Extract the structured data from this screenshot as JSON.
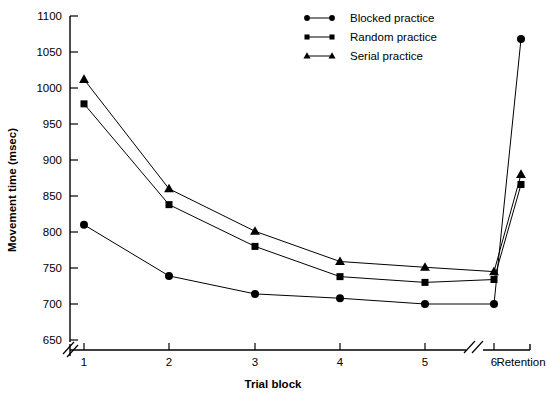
{
  "chart_data": {
    "type": "line",
    "title": "",
    "xlabel": "Trial block",
    "ylabel": "Movement time (msec)",
    "categories": [
      "1",
      "2",
      "3",
      "4",
      "5",
      "6",
      "Retention"
    ],
    "x_tick_labels": [
      "1",
      "2",
      "3",
      "4",
      "5",
      "6",
      "Retention"
    ],
    "y_tick_labels": [
      "650",
      "700",
      "750",
      "800",
      "850",
      "900",
      "950",
      "1000",
      "1050",
      "1100"
    ],
    "y_ticks": [
      650,
      700,
      750,
      800,
      850,
      900,
      950,
      1000,
      1050,
      1100
    ],
    "ylim": [
      650,
      1100
    ],
    "y_axis_break": true,
    "x_axis_break_before_retention": true,
    "grid": false,
    "legend_position": "top-center",
    "series": [
      {
        "name": "Blocked practice",
        "marker": "circle",
        "color": "#000000",
        "values": [
          810,
          739,
          714,
          708,
          700,
          700,
          1068
        ]
      },
      {
        "name": "Random practice",
        "marker": "square",
        "color": "#000000",
        "values": [
          978,
          838,
          780,
          738,
          730,
          734,
          866
        ]
      },
      {
        "name": "Serial practice",
        "marker": "triangle",
        "color": "#000000",
        "values": [
          1012,
          860,
          801,
          759,
          751,
          745,
          880
        ]
      }
    ]
  },
  "legend": {
    "items": [
      {
        "label": "Blocked practice",
        "marker": "circle"
      },
      {
        "label": "Random practice",
        "marker": "square"
      },
      {
        "label": "Serial practice",
        "marker": "triangle"
      }
    ]
  },
  "axes": {
    "y_title": "Movement time (msec)",
    "x_title": "Trial block"
  }
}
